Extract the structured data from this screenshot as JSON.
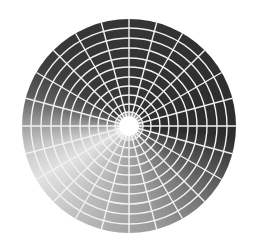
{
  "figure": {
    "center": [
      129,
      126
    ],
    "outer_radius": 107,
    "inner_radius": 10,
    "spoke_count": 24,
    "ring_radii": [
      14,
      22,
      31,
      40,
      49,
      59,
      68,
      78,
      88,
      98
    ],
    "colors": {
      "background": "#ffffff",
      "grid_line": "#f2f2f2",
      "darkest": "#2c2c2c",
      "lightest": "#e2e2e2"
    }
  }
}
